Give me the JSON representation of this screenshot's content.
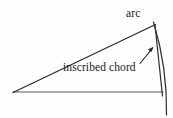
{
  "figure": {
    "title": "",
    "background_color": "#fefefe",
    "stroke_color": "#2b2b2b",
    "labels": {
      "arc": "arc",
      "inscribed_chord": "inscribed chord"
    },
    "geometry": {
      "description": "Thin circular sector with a chord inscribed in its arc",
      "apex_vertex": {
        "x": 13,
        "y": 92
      },
      "horizontal_radius_end": {
        "x": 162,
        "y": 92
      },
      "slanted_radius_end": {
        "x": 155,
        "y": 25
      },
      "chord_endpoints": [
        {
          "x": 155,
          "y": 25
        },
        {
          "x": 162,
          "y": 92
        }
      ],
      "arc_endpoints": [
        {
          "x": 154,
          "y": 23
        },
        {
          "x": 166,
          "y": 115
        }
      ],
      "arc_bulge_direction": "right",
      "leader_arrow": {
        "from": {
          "x": 140,
          "y": 63
        },
        "to": {
          "x": 153,
          "y": 48
        }
      }
    }
  }
}
